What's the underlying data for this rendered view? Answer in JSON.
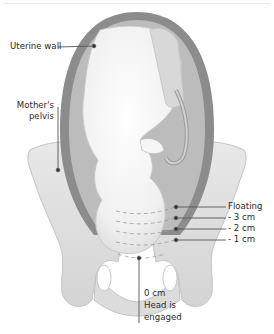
{
  "figure": {
    "labels": {
      "uterine_wall": "Uterine wall",
      "mothers_pelvis_line1": "Mother's",
      "mothers_pelvis_line2": "pelvis",
      "floating": "Floating",
      "minus3": "- 3 cm",
      "minus2": "- 2 cm",
      "minus1": "- 1 cm",
      "zero_line1": "0 cm",
      "zero_line2": "Head is",
      "zero_line3": "engaged"
    },
    "colors": {
      "uterine_wall": "#8c8c8c",
      "uterus_inner": "#bdbdbd",
      "pelvis": "#dedede",
      "fetus": "#f3f3f3",
      "leader_line": "#555555",
      "text": "#2a2a2a"
    }
  }
}
